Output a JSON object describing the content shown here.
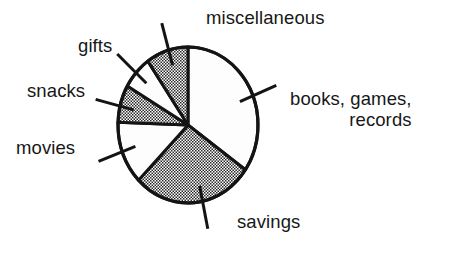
{
  "figure": {
    "kind": "pie-chart-illustration",
    "background_color": "#ffffff",
    "ink_color": "#141414"
  },
  "chart_data": {
    "type": "pie",
    "title": "",
    "subtitle": "",
    "xlabel": "",
    "ylabel": "",
    "grid": false,
    "legend_position": "none",
    "label_style": "external labels with leader lines",
    "center": {
      "x": 188,
      "y": 125
    },
    "radius_x": 70,
    "radius_y": 78,
    "start_angle_deg": 0,
    "direction": "clockwise",
    "categories": [
      "books, games, records",
      "savings",
      "movies",
      "snacks",
      "gifts",
      "miscellaneous"
    ],
    "values": [
      34.7,
      27.8,
      13.1,
      7.8,
      6.9,
      9.7
    ],
    "unit": "percent",
    "slices": [
      {
        "label": "books, games, records",
        "label_lines": [
          "books, games,",
          "records"
        ],
        "value": 34.7,
        "start_deg": 0,
        "end_deg": 125,
        "fill": "white",
        "fill_color": "#fdfdfd",
        "label_side": "right",
        "leader_angle_deg": 68
      },
      {
        "label": "savings",
        "label_lines": [
          "savings"
        ],
        "value": 27.8,
        "start_deg": 125,
        "end_deg": 225,
        "fill": "stipple",
        "fill_color": "#d5d5d5",
        "label_side": "bottom",
        "leader_angle_deg": 168
      },
      {
        "label": "movies",
        "label_lines": [
          "movies"
        ],
        "value": 13.1,
        "start_deg": 225,
        "end_deg": 272,
        "fill": "white",
        "fill_color": "#fdfdfd",
        "label_side": "left",
        "leader_angle_deg": 250
      },
      {
        "label": "snacks",
        "label_lines": [
          "snacks"
        ],
        "value": 7.8,
        "start_deg": 272,
        "end_deg": 300,
        "fill": "stipple",
        "fill_color": "#d5d5d5",
        "label_side": "left",
        "leader_angle_deg": 284
      },
      {
        "label": "gifts",
        "label_lines": [
          "gifts"
        ],
        "value": 6.9,
        "start_deg": 300,
        "end_deg": 325,
        "fill": "white",
        "fill_color": "#fdfdfd",
        "label_side": "upper-left",
        "leader_angle_deg": 312
      },
      {
        "label": "miscellaneous",
        "label_lines": [
          "miscellaneous"
        ],
        "value": 9.7,
        "start_deg": 325,
        "end_deg": 360,
        "fill": "stipple",
        "fill_color": "#d5d5d5",
        "label_side": "top",
        "leader_angle_deg": 344
      }
    ]
  },
  "labels": {
    "miscellaneous": "miscellaneous",
    "gifts": "gifts",
    "snacks": "snacks",
    "movies": "movies",
    "books_line1": "books, games,",
    "books_line2": "records",
    "savings": "savings"
  }
}
